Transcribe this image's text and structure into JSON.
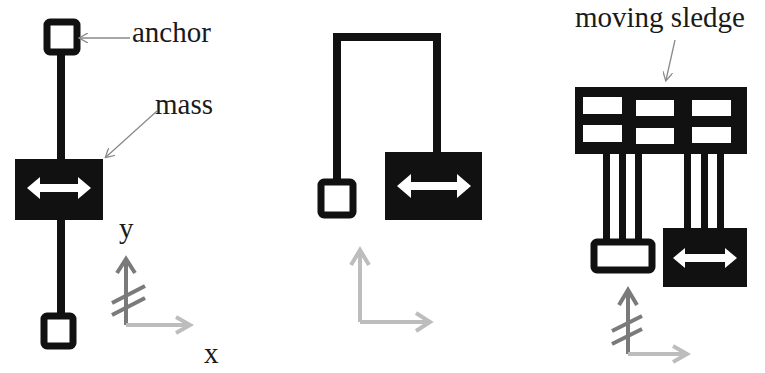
{
  "diagram": {
    "type": "MEMS spring-mass schematics",
    "panels": [
      {
        "id": "single-anchor-suspension",
        "labels": {
          "anchor": "anchor",
          "mass": "mass",
          "y_axis": "y",
          "x_axis": "x"
        },
        "elements": [
          "anchor-top",
          "spring-beam",
          "proof-mass",
          "anchor-bottom",
          "axes-with-y-blocked"
        ]
      },
      {
        "id": "folded-beam-suspension",
        "labels": {},
        "elements": [
          "anchor",
          "folded-beam",
          "proof-mass",
          "axes-free"
        ]
      },
      {
        "id": "moving-sledge-suspension",
        "labels": {
          "sledge": "moving sledge"
        },
        "elements": [
          "sledge-frame",
          "beam-set-left",
          "beam-set-right",
          "anchor-rect",
          "proof-mass",
          "axes-with-y-blocked"
        ]
      }
    ],
    "colors": {
      "structure": "#111111",
      "fill_white": "#ffffff",
      "leader_line": "#8a8a8a",
      "axis_dark": "#7a7a7a",
      "axis_light": "#bdbdbd"
    }
  }
}
